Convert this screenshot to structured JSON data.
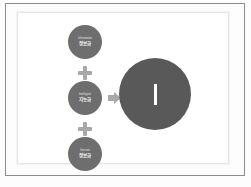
{
  "slide": {
    "inputs": [
      {
        "en": "Information",
        "ko": "정보화",
        "icon": "circle-node"
      },
      {
        "en": "Intelligent",
        "ko": "지능화",
        "icon": "circle-node"
      },
      {
        "en": "Internet",
        "ko": "정보화",
        "icon": "circle-node"
      }
    ],
    "operators": [
      {
        "symbol": "+",
        "icon": "plus-icon"
      },
      {
        "symbol": "+",
        "icon": "plus-icon"
      }
    ],
    "arrow": {
      "icon": "arrow-right-icon"
    },
    "result": {
      "glyph": "I",
      "icon": "result-circle"
    }
  },
  "colors": {
    "input_circle": "#6e6e6e",
    "result_circle": "#595959",
    "operator": "#a8a8a8",
    "frame": "#8c8c8c",
    "slide_background": "#ffffff",
    "page_background": "#fdfdfd",
    "glyph": "#ffffff"
  }
}
